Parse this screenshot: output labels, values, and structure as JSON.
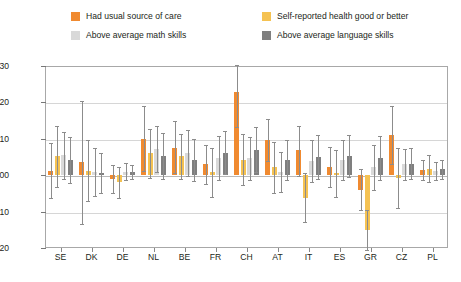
{
  "legend": {
    "items": [
      {
        "label": "Had usual source of care",
        "color": "#f08a30",
        "key": "care"
      },
      {
        "label": "Self-reported health good or better",
        "color": "#f5c252",
        "key": "health"
      },
      {
        "label": "Above average math skills",
        "color": "#d9d9d9",
        "key": "math"
      },
      {
        "label": "Above average language skills",
        "color": "#7f7f7f",
        "key": "language"
      }
    ]
  },
  "axes": {
    "y_ticks": [
      "0.30",
      "0.20",
      "0.10",
      "0.00",
      "-0.10",
      "-0.20"
    ],
    "y_values": [
      0.3,
      0.2,
      0.1,
      0.0,
      -0.1,
      -0.2
    ],
    "y_min": -0.2,
    "y_max": 0.3,
    "x_labels": [
      "SE",
      "DK",
      "DE",
      "NL",
      "BE",
      "FR",
      "CH",
      "AT",
      "IT",
      "ES",
      "GR",
      "CZ",
      "PL"
    ]
  },
  "chart_data": {
    "type": "bar",
    "title": "",
    "subtitle": "",
    "xlabel": "",
    "ylabel": "",
    "ylim": [
      -0.2,
      0.3
    ],
    "grid": true,
    "legend_position": "top",
    "categories": [
      "SE",
      "DK",
      "DE",
      "NL",
      "BE",
      "FR",
      "CH",
      "AT",
      "IT",
      "ES",
      "GR",
      "CZ",
      "PL"
    ],
    "series": [
      {
        "name": "Had usual source of care",
        "color": "#f08a30",
        "values": [
          0.012,
          0.035,
          -0.01,
          0.1,
          0.076,
          0.03,
          0.228,
          0.098,
          0.068,
          0.022,
          -0.04,
          0.11,
          0.014
        ],
        "err_low": [
          -0.063,
          -0.135,
          -0.048,
          0.012,
          0.005,
          -0.023,
          0.132,
          0.04,
          -0.001,
          -0.033,
          -0.096,
          0.032,
          -0.014
        ],
        "err_high": [
          0.088,
          0.203,
          0.028,
          0.19,
          0.148,
          0.083,
          0.303,
          0.155,
          0.135,
          0.077,
          0.018,
          0.19,
          0.043
        ]
      },
      {
        "name": "Self-reported health good or better",
        "color": "#f5c252",
        "values": [
          0.052,
          0.012,
          -0.02,
          0.06,
          0.052,
          0.008,
          0.042,
          0.022,
          -0.062,
          0.005,
          -0.15,
          -0.008,
          0.018
        ],
        "err_low": [
          -0.032,
          -0.072,
          -0.062,
          -0.008,
          -0.01,
          -0.06,
          -0.028,
          -0.05,
          -0.128,
          -0.06,
          -0.205,
          -0.09,
          -0.02
        ],
        "err_high": [
          0.135,
          0.098,
          0.022,
          0.128,
          0.112,
          0.075,
          0.112,
          0.092,
          0.005,
          0.07,
          -0.095,
          0.075,
          0.056
        ]
      },
      {
        "name": "Above average math skills",
        "color": "#d9d9d9",
        "values": [
          0.056,
          0.008,
          0.01,
          0.072,
          0.062,
          0.048,
          0.046,
          0.01,
          0.04,
          0.042,
          0.022,
          0.03,
          0.012
        ],
        "err_low": [
          -0.01,
          -0.058,
          -0.012,
          0.01,
          -0.002,
          -0.012,
          -0.012,
          -0.045,
          -0.018,
          -0.013,
          -0.04,
          -0.013,
          -0.012
        ],
        "err_high": [
          0.12,
          0.074,
          0.033,
          0.135,
          0.125,
          0.108,
          0.105,
          0.065,
          0.098,
          0.097,
          0.083,
          0.073,
          0.037
        ]
      },
      {
        "name": "Above average language skills",
        "color": "#7f7f7f",
        "values": [
          0.042,
          0.005,
          0.008,
          0.052,
          0.042,
          0.062,
          0.07,
          0.042,
          0.05,
          0.052,
          0.048,
          0.032,
          0.016
        ],
        "err_low": [
          -0.022,
          -0.048,
          -0.01,
          -0.01,
          -0.015,
          0.002,
          0.008,
          -0.012,
          -0.01,
          -0.005,
          -0.012,
          -0.01,
          -0.01
        ],
        "err_high": [
          0.105,
          0.06,
          0.028,
          0.115,
          0.1,
          0.122,
          0.132,
          0.097,
          0.11,
          0.11,
          0.108,
          0.075,
          0.042
        ]
      }
    ]
  }
}
